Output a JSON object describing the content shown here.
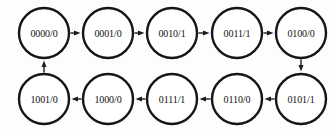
{
  "diagram": {
    "type": "directed-cycle-graph",
    "colors": {
      "background": "#fdfdfd",
      "node_stroke": "#161616",
      "node_fill": "#ffffff",
      "edge": "#2a2a2a",
      "text": "#111111"
    },
    "node_radius": 25,
    "nodes": [
      {
        "id": "n0",
        "label": "0000/0",
        "cx": 44,
        "cy": 33
      },
      {
        "id": "n1",
        "label": "0001/0",
        "cx": 108,
        "cy": 33
      },
      {
        "id": "n2",
        "label": "0010/1",
        "cx": 172,
        "cy": 33
      },
      {
        "id": "n3",
        "label": "0011/1",
        "cx": 237,
        "cy": 33
      },
      {
        "id": "n4",
        "label": "0100/0",
        "cx": 301,
        "cy": 33
      },
      {
        "id": "n5",
        "label": "0101/1",
        "cx": 301,
        "cy": 99
      },
      {
        "id": "n6",
        "label": "0110/0",
        "cx": 237,
        "cy": 99
      },
      {
        "id": "n7",
        "label": "0111/1",
        "cx": 172,
        "cy": 99
      },
      {
        "id": "n8",
        "label": "1000/0",
        "cx": 108,
        "cy": 99
      },
      {
        "id": "n9",
        "label": "1001/0",
        "cx": 44,
        "cy": 99
      }
    ],
    "edges": [
      {
        "from": "n0",
        "to": "n1",
        "direction": "right"
      },
      {
        "from": "n1",
        "to": "n2",
        "direction": "right"
      },
      {
        "from": "n2",
        "to": "n3",
        "direction": "right"
      },
      {
        "from": "n3",
        "to": "n4",
        "direction": "right"
      },
      {
        "from": "n4",
        "to": "n5",
        "direction": "down"
      },
      {
        "from": "n5",
        "to": "n6",
        "direction": "left"
      },
      {
        "from": "n6",
        "to": "n7",
        "direction": "left"
      },
      {
        "from": "n7",
        "to": "n8",
        "direction": "left"
      },
      {
        "from": "n8",
        "to": "n9",
        "direction": "left"
      },
      {
        "from": "n9",
        "to": "n0",
        "direction": "up"
      }
    ]
  }
}
